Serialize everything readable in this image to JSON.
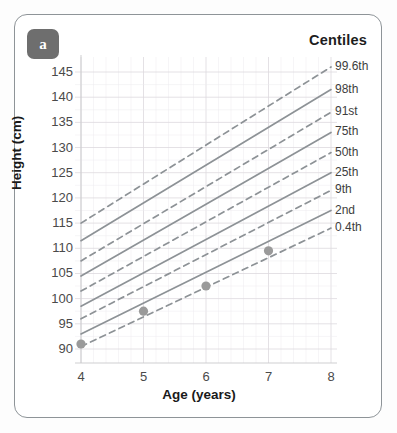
{
  "card": {
    "panel_letter": "a",
    "legend_title": "Centiles",
    "border_color": "#8e9498",
    "badge_color": "#6e6e6e"
  },
  "chart_data": {
    "type": "line",
    "title": "",
    "xlabel": "Age (years)",
    "ylabel": "Height (cm)",
    "xlim": [
      4,
      8
    ],
    "ylim": [
      88,
      147
    ],
    "xticks": [
      4,
      5,
      6,
      7,
      8
    ],
    "yticks": [
      90,
      95,
      100,
      105,
      110,
      115,
      120,
      125,
      130,
      135,
      140,
      145
    ],
    "grid": true,
    "legend_position": "right",
    "line_color": "#8d9296",
    "point_color": "#9a9a9a",
    "series": [
      {
        "name": "99.6th",
        "style": "dashed",
        "x": [
          4,
          8
        ],
        "values": [
          115.0,
          146.0
        ]
      },
      {
        "name": "98th",
        "style": "solid",
        "x": [
          4,
          8
        ],
        "values": [
          111.5,
          141.5
        ]
      },
      {
        "name": "91st",
        "style": "dashed",
        "x": [
          4,
          8
        ],
        "values": [
          107.5,
          137.0
        ]
      },
      {
        "name": "75th",
        "style": "solid",
        "x": [
          4,
          8
        ],
        "values": [
          104.5,
          133.0
        ]
      },
      {
        "name": "50th",
        "style": "dashed",
        "x": [
          4,
          8
        ],
        "values": [
          101.5,
          129.0
        ]
      },
      {
        "name": "25th",
        "style": "solid",
        "x": [
          4,
          8
        ],
        "values": [
          98.5,
          125.0
        ]
      },
      {
        "name": "9th",
        "style": "dashed",
        "x": [
          4,
          8
        ],
        "values": [
          96.0,
          121.5
        ]
      },
      {
        "name": "2nd",
        "style": "solid",
        "x": [
          4,
          8
        ],
        "values": [
          93.0,
          117.5
        ]
      },
      {
        "name": "0.4th",
        "style": "dashed",
        "x": [
          4,
          8
        ],
        "values": [
          90.5,
          114.0
        ]
      }
    ],
    "measurements": {
      "name": "child measurements",
      "marker": "circle",
      "points": [
        {
          "x": 4,
          "y": 91.0
        },
        {
          "x": 5,
          "y": 97.5
        },
        {
          "x": 6,
          "y": 102.5
        },
        {
          "x": 7,
          "y": 109.5
        }
      ]
    }
  }
}
